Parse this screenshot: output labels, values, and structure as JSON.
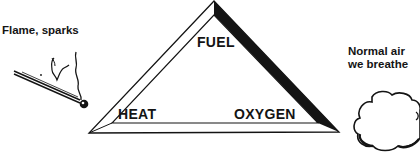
{
  "diagram": {
    "triangle": {
      "top_label": "FUEL",
      "left_label": "HEAT",
      "right_label": "OXYGEN"
    },
    "sources": {
      "heat_source_label": "Flame, sparks",
      "heat_source_icon": "match-icon",
      "oxygen_source_line1": "Normal air",
      "oxygen_source_line2": "we breathe",
      "oxygen_source_icon": "cloud-icon"
    },
    "colors": {
      "ink": "#141414",
      "background": "#ffffff"
    }
  }
}
